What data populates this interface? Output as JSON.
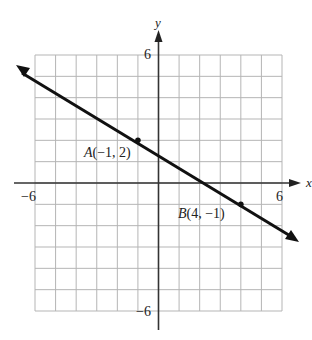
{
  "chart_data": {
    "type": "line",
    "title": "",
    "xlabel": "x",
    "ylabel": "y",
    "xlim": [
      -6,
      6
    ],
    "ylim": [
      -6,
      6
    ],
    "grid": true,
    "x_ticks_labeled": [
      "-6",
      "6"
    ],
    "y_ticks_labeled": [
      "6",
      "-6"
    ],
    "line": {
      "slope": -0.6,
      "intercept": 1.4,
      "equation": "y = -3/5 x + 7/5",
      "arrows_both_ends": true
    },
    "points": [
      {
        "name": "A",
        "x": -1,
        "y": 2,
        "label": "A(−1, 2)"
      },
      {
        "name": "B",
        "x": 4,
        "y": -1,
        "label": "B(4, −1)"
      }
    ]
  },
  "labels": {
    "x_axis": "x",
    "y_axis": "y",
    "x_min": "−6",
    "x_max": "6",
    "y_max": "6",
    "y_min": "−6",
    "point_a_letter": "A",
    "point_a_coords": "(−1, 2)",
    "point_b_letter": "B",
    "point_b_coords": "(4, −1)"
  },
  "colors": {
    "grid": "#b5b5b5",
    "axis": "#222222",
    "line": "#111111"
  }
}
